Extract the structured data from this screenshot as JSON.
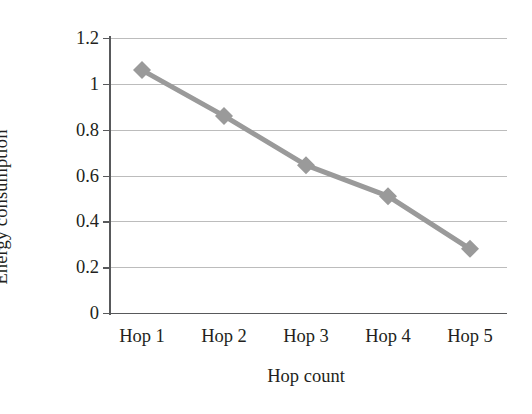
{
  "chart_data": {
    "type": "line",
    "title": "",
    "xlabel": "Hop count",
    "ylabel": "Energy consumption",
    "categories": [
      "Hop 1",
      "Hop 2",
      "Hop 3",
      "Hop 4",
      "Hop 5"
    ],
    "values": [
      1.06,
      0.86,
      0.645,
      0.51,
      0.28
    ],
    "series": [
      {
        "name": "Energy consumption",
        "values": [
          1.06,
          0.86,
          0.645,
          0.51,
          0.28
        ],
        "color": "#9a9a9a",
        "marker": "diamond"
      }
    ],
    "ylim": [
      0,
      1.2
    ],
    "ytick_labels": [
      "1.2",
      "1",
      "0.8",
      "0.6",
      "0.4",
      "0.2",
      "0"
    ],
    "ytick_values": [
      1.2,
      1.0,
      0.8,
      0.6,
      0.4,
      0.2,
      0
    ],
    "grid": true,
    "grid_axis": "y",
    "legend": "none",
    "colors": {
      "series": "#9a9a9a",
      "gridline": "#bcbcbc",
      "axis": "#58595b",
      "text": "#231f20",
      "background": "#ffffff"
    }
  }
}
